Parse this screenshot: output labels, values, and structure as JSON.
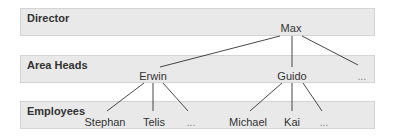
{
  "diagram": {
    "type": "org-chart",
    "bands": [
      {
        "label": "Director"
      },
      {
        "label": "Area Heads"
      },
      {
        "label": "Employees"
      }
    ],
    "nodes": {
      "max": "Max",
      "erwin": "Erwin",
      "guido": "Guido",
      "area_more": "...",
      "stephan": "Stephan",
      "telis": "Telis",
      "erwin_more": "...",
      "michael": "Michael",
      "kai": "Kai",
      "guido_more": "..."
    },
    "edges": [
      [
        "Max",
        "Erwin"
      ],
      [
        "Max",
        "Guido"
      ],
      [
        "Max",
        "..."
      ],
      [
        "Erwin",
        "Stephan"
      ],
      [
        "Erwin",
        "Telis"
      ],
      [
        "Erwin",
        "..."
      ],
      [
        "Guido",
        "Michael"
      ],
      [
        "Guido",
        "Kai"
      ],
      [
        "Guido",
        "..."
      ]
    ],
    "colors": {
      "band_fill": "#e9e9e9",
      "band_border": "#d4d4d4",
      "line": "#333333",
      "text": "#333333"
    }
  }
}
